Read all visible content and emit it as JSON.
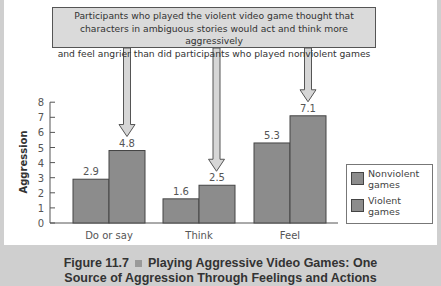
{
  "callout": {
    "lines": [
      "Participants who played the violent video game thought that",
      "characters in ambiguous stories would act and think more aggressively",
      "and feel angrier than did participants who played nonviolent games"
    ]
  },
  "legend": {
    "items": [
      {
        "label_line1": "Nonviolent",
        "label_line2": "games"
      },
      {
        "label_line1": "Violent",
        "label_line2": "games"
      }
    ]
  },
  "caption": {
    "figure": "Figure 11.7",
    "title_line1": "Playing Aggressive Video Games: One",
    "title_line2": "Source of Aggression Through Feelings and Actions"
  },
  "colors": {
    "bar_fill": "#8c8c8c",
    "bar_stroke": "#444444",
    "callout_fill": "#dadada",
    "arrow_fill": "#d6d6d6",
    "page_bg": "#cfcfcf"
  },
  "chart_data": {
    "type": "bar",
    "title": "",
    "xlabel": "",
    "ylabel": "Aggression",
    "ylim": [
      0,
      8
    ],
    "yticks": [
      "0",
      "1",
      "2",
      "3",
      "4",
      "5",
      "6",
      "7",
      "8"
    ],
    "categories": [
      "Do or say",
      "Think",
      "Feel"
    ],
    "series": [
      {
        "name": "Nonviolent games",
        "values": [
          2.9,
          1.6,
          5.3
        ]
      },
      {
        "name": "Violent games",
        "values": [
          4.8,
          2.5,
          7.1
        ]
      }
    ],
    "value_labels": [
      [
        "2.9",
        "1.6",
        "5.3"
      ],
      [
        "4.8",
        "2.5",
        "7.1"
      ]
    ],
    "grid": false,
    "legend_position": "right-bottom",
    "annotation": "Participants who played the violent video game thought that characters in ambiguous stories would act and think more aggressively and feel angrier than did participants who played nonviolent games"
  }
}
